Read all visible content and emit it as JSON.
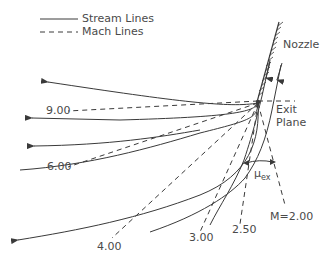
{
  "legend": {
    "stream": "Stream Lines",
    "mach": "Mach Lines"
  },
  "labels": {
    "nozzle": "Nozzle",
    "exit_line1": "Exit",
    "exit_line2": "Plane",
    "mu": "μ",
    "mu_sub": "ex"
  },
  "mach_lines": [
    {
      "label": "9.00"
    },
    {
      "label": "6.00"
    },
    {
      "label": "4.00"
    },
    {
      "label": "3.00"
    },
    {
      "label": "2.50"
    },
    {
      "label": "M=2.00"
    }
  ],
  "colors": {
    "line": "#3a3a3a",
    "text": "#4a4a4a"
  }
}
